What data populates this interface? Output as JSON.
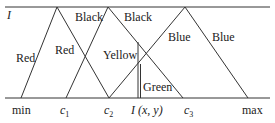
{
  "diagram": {
    "axis_label_top": "I",
    "region_labels": [
      {
        "id": "red-left",
        "text": "Red",
        "x": 16,
        "y": 54
      },
      {
        "id": "red-right",
        "text": "Red",
        "x": 55,
        "y": 46
      },
      {
        "id": "black-left",
        "text": "Black",
        "x": 76,
        "y": 13
      },
      {
        "id": "black-right",
        "text": "Black",
        "x": 124,
        "y": 13
      },
      {
        "id": "yellow",
        "text": "Yellow",
        "x": 103,
        "y": 51
      },
      {
        "id": "green",
        "text": "Green",
        "x": 142,
        "y": 82
      },
      {
        "id": "blue-left",
        "text": "Blue",
        "x": 168,
        "y": 33
      },
      {
        "id": "blue-right",
        "text": "Blue",
        "x": 213,
        "y": 33
      }
    ],
    "axis_ticks": {
      "min": "min",
      "c1_base": "c",
      "c1_sub": "1",
      "c2_base": "c",
      "c2_sub": "2",
      "pixel": "I (x, y)",
      "c3_base": "c",
      "c3_sub": "3",
      "max": "max"
    },
    "line_color": "#333333"
  }
}
